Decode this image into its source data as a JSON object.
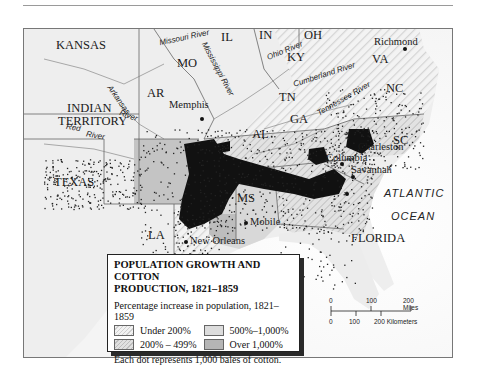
{
  "map": {
    "title_line1": "POPULATION GROWTH AND COTTON",
    "title_line2": "PRODUCTION, 1821–1859",
    "states": {
      "kansas": "KANSAS",
      "mo": "MO",
      "il": "IL",
      "in": "IN",
      "oh": "OH",
      "ky": "KY",
      "va": "VA",
      "indian_territory_1": "INDIAN",
      "indian_territory_2": "TERRITORY",
      "ar": "AR",
      "tn": "TN",
      "nc": "NC",
      "sc": "SC",
      "ga": "GA",
      "al": "AL",
      "ms": "MS",
      "la": "LA",
      "texas": "TEXAS",
      "florida": "FLORIDA"
    },
    "cities": {
      "richmond": "Richmond",
      "memphis": "Memphis",
      "columbia": "Columbia",
      "charleston": "Charleston",
      "savannah": "Savannah",
      "mobile": "Mobile",
      "new_orleans": "New Orleans"
    },
    "rivers": {
      "missouri": "Missouri River",
      "mississippi": "Mississippi River",
      "ohio": "Ohio River",
      "cumberland": "Cumberland River",
      "tennessee": "Tennessee River",
      "arkansas_1": "Arkansas",
      "arkansas_2": "River",
      "red_1": "Red",
      "red_2": "River"
    },
    "ocean": {
      "line1": "ATLANTIC",
      "line2": "OCEAN"
    }
  },
  "legend": {
    "title_line1": "POPULATION GROWTH AND COTTON",
    "title_line2": "PRODUCTION, 1821–1859",
    "subtitle": "Percentage increase in population, 1821–1859",
    "items": [
      {
        "label": "Under 200%",
        "swatch": "hatched-light",
        "color": "#e6e6e6"
      },
      {
        "label": "500%–1,000%",
        "swatch": "solid-light",
        "color": "#dcdcdc"
      },
      {
        "label": "200% – 499%",
        "swatch": "hatched-medium",
        "color": "#cfcfcf"
      },
      {
        "label": "Over 1,000%",
        "swatch": "solid-dark",
        "color": "#b5b5b5"
      }
    ],
    "note": "Each dot represents 1,000 bales of cotton."
  },
  "scale": {
    "miles_ticks": [
      "0",
      "100",
      "200 Miles"
    ],
    "km_ticks": [
      "0",
      "100",
      "200 Kilometers"
    ]
  }
}
